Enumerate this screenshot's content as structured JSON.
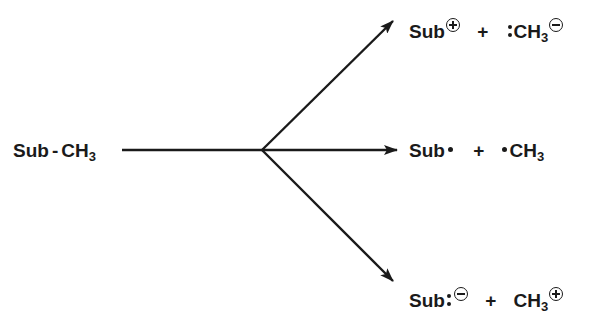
{
  "diagram": {
    "type": "bond-cleavage-scheme",
    "reactant": {
      "prefix": "Sub",
      "bond": "-",
      "group": "CH",
      "subscript": "3"
    },
    "pathways": [
      {
        "id": "heterolytic-carbanion",
        "position": "upper",
        "product1": {
          "text": "Sub",
          "charge": "plus"
        },
        "plus_sign": "+",
        "product2": {
          "prefix_electrons": "lone-pair",
          "text": "CH",
          "subscript": "3",
          "charge": "minus"
        }
      },
      {
        "id": "homolytic-radical",
        "position": "middle",
        "product1": {
          "text": "Sub",
          "radical": "dot"
        },
        "plus_sign": "+",
        "product2": {
          "prefix_electrons": "radical-dot",
          "text": "CH",
          "subscript": "3"
        }
      },
      {
        "id": "heterolytic-carbocation",
        "position": "lower",
        "product1": {
          "text": "Sub",
          "suffix_electrons": "lone-pair",
          "charge": "minus"
        },
        "plus_sign": "+",
        "product2": {
          "text": "CH",
          "subscript": "3",
          "charge": "plus"
        }
      }
    ],
    "colors": {
      "ink": "#1a1a1a",
      "background": "#ffffff"
    }
  }
}
